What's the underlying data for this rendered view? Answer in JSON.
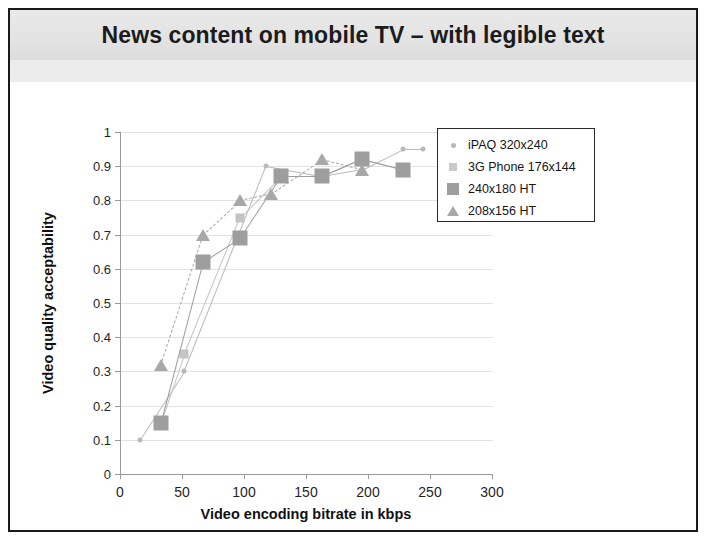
{
  "slide": {
    "title": "News content on mobile TV – with legible text"
  },
  "chart_data": {
    "type": "line",
    "title": "News content on mobile TV – with legible text",
    "xlabel": "Video encoding bitrate in kbps",
    "ylabel": "Video quality acceptability",
    "xlim": [
      0,
      300
    ],
    "ylim": [
      0,
      1
    ],
    "xticks": [
      0,
      50,
      100,
      150,
      200,
      250,
      300
    ],
    "yticks": [
      0,
      0.1,
      0.2,
      0.3,
      0.4,
      0.5,
      0.6,
      0.7,
      0.8,
      0.9,
      1
    ],
    "grid": true,
    "legend_position": "upper-right-inside",
    "series": [
      {
        "name": "iPAQ 320x240",
        "marker": "dot",
        "color": "#b9b9b9",
        "line": "solid",
        "points": [
          {
            "x": 16,
            "y": 0.1
          },
          {
            "x": 52,
            "y": 0.3
          },
          {
            "x": 118,
            "y": 0.9
          },
          {
            "x": 163,
            "y": 0.87
          },
          {
            "x": 195,
            "y": 0.89
          },
          {
            "x": 228,
            "y": 0.95
          },
          {
            "x": 244,
            "y": 0.95
          }
        ]
      },
      {
        "name": "3G Phone 176x144",
        "marker": "square-light",
        "color": "#c4c4c4",
        "line": "solid",
        "points": [
          {
            "x": 33,
            "y": 0.15
          },
          {
            "x": 52,
            "y": 0.35
          },
          {
            "x": 97,
            "y": 0.75
          },
          {
            "x": 130,
            "y": 0.87
          },
          {
            "x": 163,
            "y": 0.87
          },
          {
            "x": 195,
            "y": 0.92
          },
          {
            "x": 228,
            "y": 0.89
          }
        ]
      },
      {
        "name": "240x180 HT",
        "marker": "square-dark",
        "color": "#9e9e9e",
        "line": "solid",
        "points": [
          {
            "x": 33,
            "y": 0.15
          },
          {
            "x": 67,
            "y": 0.62
          },
          {
            "x": 97,
            "y": 0.69
          },
          {
            "x": 130,
            "y": 0.87
          },
          {
            "x": 163,
            "y": 0.87
          },
          {
            "x": 195,
            "y": 0.92
          },
          {
            "x": 228,
            "y": 0.89
          }
        ]
      },
      {
        "name": "208x156 HT",
        "marker": "triangle",
        "color": "#a8a8a8",
        "line": "dashed",
        "points": [
          {
            "x": 33,
            "y": 0.32
          },
          {
            "x": 67,
            "y": 0.7
          },
          {
            "x": 97,
            "y": 0.8
          },
          {
            "x": 122,
            "y": 0.82
          },
          {
            "x": 163,
            "y": 0.92
          },
          {
            "x": 195,
            "y": 0.89
          }
        ]
      }
    ]
  },
  "legend": {
    "items": [
      {
        "label": "iPAQ 320x240"
      },
      {
        "label": "3G Phone 176x144"
      },
      {
        "label": "240x180 HT"
      },
      {
        "label": "208x156 HT"
      }
    ]
  },
  "colors": {
    "frame": "#1a1a1a",
    "title_band": "#e6e6e6",
    "axis": "#9a9a9a",
    "grid": "#e2e2e2",
    "text": "#1f1f1f"
  }
}
